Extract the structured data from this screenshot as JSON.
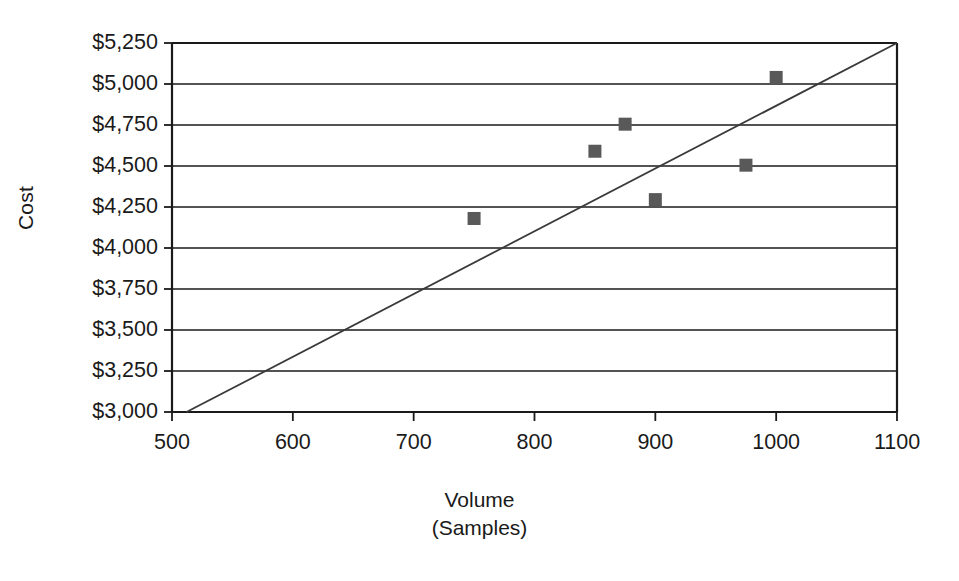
{
  "chart_data": {
    "type": "scatter",
    "title": "",
    "xlabel": "Volume (Samples)",
    "xlabel_line1": "Volume",
    "xlabel_line2": "(Samples)",
    "ylabel": "Cost",
    "xlim": [
      500,
      1100
    ],
    "ylim": [
      3000,
      5250
    ],
    "xticks": [
      500,
      600,
      700,
      800,
      900,
      1000,
      1100
    ],
    "xtick_labels": [
      "500",
      "600",
      "700",
      "800",
      "900",
      "1000",
      "1100"
    ],
    "yticks": [
      3000,
      3250,
      3500,
      3750,
      4000,
      4250,
      4500,
      4750,
      5000,
      5250
    ],
    "ytick_labels": [
      "$3,000",
      "$3,250",
      "$3,500",
      "$3,750",
      "$4,000",
      "$4,250",
      "$4,500",
      "$4,750",
      "$5,000",
      "$5,250"
    ],
    "grid": "horizontal",
    "legend": "none",
    "marker_shape": "square",
    "marker_color": "#595959",
    "line_color": "#3a3a3a",
    "axis_color": "#1a1a1a",
    "series": [
      {
        "name": "Cost observations",
        "type": "scatter",
        "points": [
          {
            "x": 750,
            "y": 4180,
            "label": "750, $4,180"
          },
          {
            "x": 850,
            "y": 4590,
            "label": "850, $4,590"
          },
          {
            "x": 875,
            "y": 4755,
            "label": "875, $4,755"
          },
          {
            "x": 900,
            "y": 4295,
            "label": "900, $4,295"
          },
          {
            "x": 975,
            "y": 4505,
            "label": "975, $4,505"
          },
          {
            "x": 1000,
            "y": 5040,
            "label": "1000, $5,040"
          }
        ]
      },
      {
        "name": "Trend line",
        "type": "line",
        "points": [
          {
            "x": 512,
            "y": 3000
          },
          {
            "x": 1100,
            "y": 5250
          }
        ]
      }
    ]
  }
}
